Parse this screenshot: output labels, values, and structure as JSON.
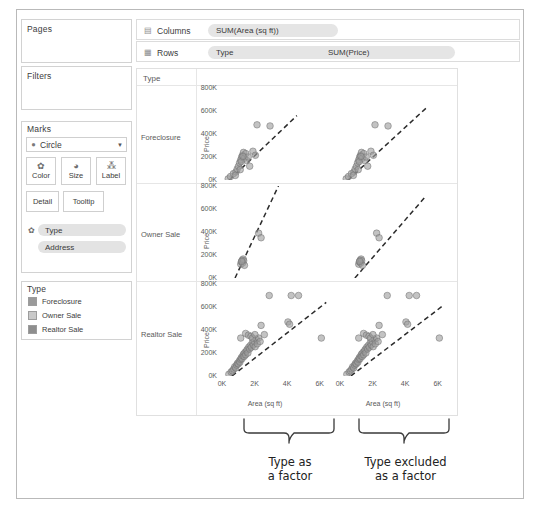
{
  "panels": {
    "pages": {
      "title": "Pages"
    },
    "filters": {
      "title": "Filters"
    },
    "marks": {
      "title": "Marks",
      "mark_type": "Circle",
      "mark_type_icon": "circle-mark-icon",
      "caret_icon": "chevron-down-icon",
      "buttons": [
        {
          "label": "Color",
          "icon": "color-palette-icon",
          "glyph": "✿"
        },
        {
          "label": "Size",
          "icon": "size-icon",
          "glyph": "◔"
        },
        {
          "label": "Label",
          "icon": "label-icon",
          "glyph": "⁂"
        }
      ],
      "buttons2": [
        {
          "label": "Detail",
          "icon": "detail-icon"
        },
        {
          "label": "Tooltip",
          "icon": "tooltip-icon"
        }
      ],
      "pills": [
        {
          "label": "Type",
          "icon": "color-palette-icon"
        },
        {
          "label": "Address",
          "icon": ""
        }
      ]
    },
    "legend": {
      "title": "Type",
      "items": [
        {
          "label": "Foreclosure",
          "color": "#9a9a9a"
        },
        {
          "label": "Owner Sale",
          "color": "#c4c4c4"
        },
        {
          "label": "Realtor Sale",
          "color": "#8e8e8e"
        }
      ]
    }
  },
  "shelves": {
    "columns": {
      "name": "Columns",
      "icon": "columns-icon",
      "pills": [
        {
          "label": "SUM(Area (sq ft))"
        }
      ]
    },
    "rows": {
      "name": "Rows",
      "icon": "rows-icon",
      "pills": [
        {
          "label": "Type"
        },
        {
          "label": "SUM(Price)"
        }
      ]
    }
  },
  "viz": {
    "corner_label": "Type",
    "row_headers": [
      "Foreclosure",
      "Owner Sale",
      "Realtor Sale"
    ],
    "y_axis_title": "Price",
    "x_axis_title": "Area (sq ft)",
    "y_ticks": [
      "800K",
      "600K",
      "400K",
      "200K",
      "0K"
    ],
    "x_ticks": [
      "0K",
      "2K",
      "4K",
      "6K"
    ]
  },
  "annotations": [
    {
      "text_line1": "Type as",
      "text_line2": "a factor"
    },
    {
      "text_line1": "Type excluded",
      "text_line2": "as a factor"
    }
  ],
  "chart_data": {
    "type": "scatter",
    "title": "",
    "xlabel": "Area (sq ft)",
    "ylabel": "Price",
    "xlim": [
      0,
      7000
    ],
    "ylim": [
      0,
      800000
    ],
    "x_ticks": [
      0,
      2000,
      4000,
      6000
    ],
    "y_ticks": [
      0,
      200000,
      400000,
      600000,
      800000
    ],
    "grid": false,
    "legend": "right-panel",
    "facet_rows": [
      "Foreclosure",
      "Owner Sale",
      "Realtor Sale"
    ],
    "facet_cols": [
      "Type as a factor",
      "Type excluded as a factor"
    ],
    "series": [
      {
        "name": "Foreclosure",
        "points": [
          [
            380,
            10000
          ],
          [
            520,
            30000
          ],
          [
            700,
            55000
          ],
          [
            860,
            70000
          ],
          [
            930,
            95000
          ],
          [
            1010,
            120000
          ],
          [
            1080,
            150000
          ],
          [
            1150,
            175000
          ],
          [
            1210,
            200000
          ],
          [
            1260,
            215000
          ],
          [
            1320,
            240000
          ],
          [
            1380,
            190000
          ],
          [
            1460,
            230000
          ],
          [
            1520,
            170000
          ],
          [
            1610,
            200000
          ],
          [
            1700,
            120000
          ],
          [
            1900,
            250000
          ],
          [
            2150,
            480000
          ],
          [
            2950,
            470000
          ],
          [
            2050,
            215000
          ],
          [
            1120,
            90000
          ],
          [
            820,
            40000
          ],
          [
            1180,
            160000
          ],
          [
            1290,
            205000
          ]
        ],
        "trend_by_type": {
          "x0": 300,
          "y0": -20000,
          "x1": 4600,
          "y1": 560000
        },
        "trend_common": {
          "x0": 300,
          "y0": -25000,
          "x1": 5400,
          "y1": 640000
        }
      },
      {
        "name": "Owner Sale",
        "points": [
          [
            1150,
            120000
          ],
          [
            1190,
            140000
          ],
          [
            1240,
            155000
          ],
          [
            1270,
            130000
          ],
          [
            1300,
            165000
          ],
          [
            1330,
            150000
          ],
          [
            1380,
            110000
          ],
          [
            2250,
            390000
          ],
          [
            2400,
            350000
          ],
          [
            1210,
            145000
          ]
        ],
        "trend_by_type": {
          "x0": 700,
          "y0": -30000,
          "x1": 3600,
          "y1": 840000
        },
        "trend_common": {
          "x0": 700,
          "y0": -35000,
          "x1": 5200,
          "y1": 700000
        }
      },
      {
        "name": "Realtor Sale",
        "points": [
          [
            420,
            15000
          ],
          [
            560,
            35000
          ],
          [
            640,
            45000
          ],
          [
            720,
            60000
          ],
          [
            780,
            80000
          ],
          [
            840,
            70000
          ],
          [
            900,
            95000
          ],
          [
            950,
            110000
          ],
          [
            1000,
            105000
          ],
          [
            1060,
            130000
          ],
          [
            1100,
            120000
          ],
          [
            1140,
            145000
          ],
          [
            1190,
            160000
          ],
          [
            1230,
            150000
          ],
          [
            1280,
            175000
          ],
          [
            1320,
            190000
          ],
          [
            1360,
            170000
          ],
          [
            1410,
            205000
          ],
          [
            1450,
            185000
          ],
          [
            1500,
            215000
          ],
          [
            1540,
            230000
          ],
          [
            1590,
            200000
          ],
          [
            1640,
            250000
          ],
          [
            1690,
            235000
          ],
          [
            1740,
            265000
          ],
          [
            1800,
            250000
          ],
          [
            1860,
            290000
          ],
          [
            1920,
            270000
          ],
          [
            1980,
            300000
          ],
          [
            2040,
            255000
          ],
          [
            2100,
            320000
          ],
          [
            2170,
            280000
          ],
          [
            2250,
            330000
          ],
          [
            2340,
            300000
          ],
          [
            1150,
            330000
          ],
          [
            2400,
            440000
          ],
          [
            2900,
            700000
          ],
          [
            4250,
            700000
          ],
          [
            4700,
            700000
          ],
          [
            4050,
            470000
          ],
          [
            4150,
            450000
          ],
          [
            6100,
            330000
          ],
          [
            1450,
            370000
          ],
          [
            1620,
            355000
          ],
          [
            1780,
            345000
          ],
          [
            2600,
            360000
          ],
          [
            1870,
            330000
          ],
          [
            2020,
            360000
          ]
        ],
        "trend_by_type": {
          "x0": 250,
          "y0": -40000,
          "x1": 6400,
          "y1": 640000
        },
        "trend_common": {
          "x0": 250,
          "y0": -45000,
          "x1": 6400,
          "y1": 620000
        }
      }
    ]
  }
}
